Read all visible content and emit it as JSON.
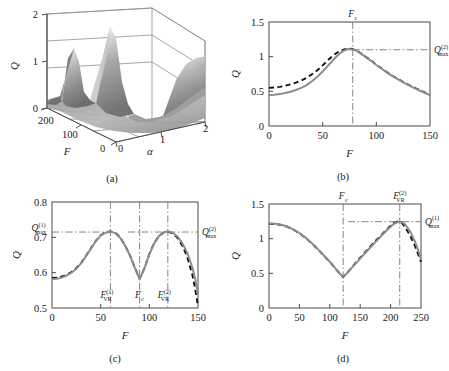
{
  "figure": {
    "panels": [
      {
        "key": "a",
        "caption": "(a)"
      },
      {
        "key": "b",
        "caption": "(b)"
      },
      {
        "key": "c",
        "caption": "(c)"
      },
      {
        "key": "d",
        "caption": "(d)"
      }
    ]
  },
  "chart_data": [
    {
      "id": "a",
      "type": "surface",
      "title": "",
      "caption": "(a)",
      "xlabel": "F",
      "ylabel": "α",
      "zlabel": "Q",
      "xticks": [
        "0",
        "100",
        "200"
      ],
      "xtickvals": [
        0,
        100,
        200
      ],
      "yticks": [
        "0",
        "1",
        "2"
      ],
      "ytickvals": [
        0,
        1,
        2
      ],
      "zticks": [
        "0",
        "1",
        "2"
      ],
      "ztickvals": [
        0,
        1,
        2
      ],
      "xlim": [
        0,
        200
      ],
      "ylim": [
        0,
        2
      ],
      "zlim": [
        0,
        2
      ],
      "colormap": "grayscale",
      "description": "Response amplitude Q surface over F and alpha with two sharp ridge peaks reaching Q near 2 and a valley between them",
      "peaks": [
        {
          "F": 60,
          "alpha": 0.25,
          "Q": 1.95
        },
        {
          "F": 120,
          "alpha": 0.55,
          "Q": 2.0
        }
      ],
      "valley": {
        "F": 95,
        "alpha": 1.1,
        "Q": 0.35
      }
    },
    {
      "id": "b",
      "type": "line",
      "caption": "(b)",
      "xlabel": "F",
      "ylabel": "Q",
      "xlim": [
        0,
        150
      ],
      "ylim": [
        0,
        1.5
      ],
      "xticks": [
        "0",
        "50",
        "100",
        "150"
      ],
      "xtickvals": [
        0,
        50,
        100,
        150
      ],
      "yticks": [
        "0",
        "0.5",
        "1",
        "1.5"
      ],
      "ytickvals": [
        0,
        0.5,
        1,
        1.5
      ],
      "grid": false,
      "annotations": [
        {
          "text": "F",
          "sub": "c",
          "base": "F",
          "kind": "vertical-marker",
          "x": 78,
          "position": "top"
        },
        {
          "text": "Q",
          "sub": "max",
          "sup": "(2)",
          "base": "Q",
          "kind": "horizontal-marker",
          "y": 1.1,
          "position": "right"
        }
      ],
      "series": [
        {
          "name": "theory-dashed",
          "style": "dashed",
          "color": "#111111",
          "x": [
            0,
            5,
            10,
            15,
            20,
            25,
            30,
            35,
            40,
            45,
            50,
            55,
            60,
            65,
            70,
            74,
            78,
            82,
            86,
            90,
            95,
            100,
            105,
            110,
            115,
            120,
            125,
            130,
            135,
            140,
            145,
            150
          ],
          "y": [
            0.55,
            0.555,
            0.565,
            0.58,
            0.6,
            0.625,
            0.655,
            0.695,
            0.745,
            0.805,
            0.875,
            0.95,
            1.02,
            1.075,
            1.105,
            1.115,
            1.11,
            1.085,
            1.045,
            1.0,
            0.945,
            0.885,
            0.83,
            0.775,
            0.725,
            0.68,
            0.635,
            0.595,
            0.555,
            0.52,
            0.485,
            0.45
          ]
        },
        {
          "name": "numerical-solid",
          "style": "solid",
          "color": "#8c8c8c",
          "x": [
            0,
            5,
            10,
            15,
            20,
            25,
            30,
            35,
            40,
            45,
            50,
            55,
            60,
            65,
            70,
            74,
            78,
            82,
            86,
            90,
            95,
            100,
            105,
            110,
            115,
            120,
            125,
            130,
            135,
            140,
            145,
            150
          ],
          "y": [
            0.445,
            0.45,
            0.46,
            0.475,
            0.495,
            0.52,
            0.55,
            0.59,
            0.645,
            0.71,
            0.785,
            0.87,
            0.955,
            1.035,
            1.09,
            1.11,
            1.105,
            1.08,
            1.04,
            0.995,
            0.94,
            0.88,
            0.825,
            0.77,
            0.72,
            0.675,
            0.63,
            0.59,
            0.55,
            0.515,
            0.48,
            0.445
          ]
        }
      ]
    },
    {
      "id": "c",
      "type": "line",
      "caption": "(c)",
      "xlabel": "F",
      "ylabel": "Q",
      "xlim": [
        0,
        150
      ],
      "ylim": [
        0.5,
        0.8
      ],
      "xticks": [
        "0",
        "50",
        "100",
        "150"
      ],
      "xtickvals": [
        0,
        50,
        100,
        150
      ],
      "yticks": [
        "0.5",
        "0.6",
        "0.7",
        "0.8"
      ],
      "ytickvals": [
        0.5,
        0.6,
        0.7,
        0.8
      ],
      "grid": false,
      "annotations": [
        {
          "text": "Q",
          "sub": "max",
          "sup": "(1)",
          "base": "Q",
          "kind": "horizontal-marker",
          "y": 0.715,
          "position": "left"
        },
        {
          "text": "Q",
          "sub": "max",
          "sup": "(2)",
          "base": "Q",
          "kind": "horizontal-marker",
          "y": 0.715,
          "position": "right"
        },
        {
          "text": "F",
          "sub": "VR",
          "sup": "(1)",
          "base": "F",
          "kind": "vertical-marker",
          "x": 60,
          "position": "bottom"
        },
        {
          "text": "F",
          "sub": "c",
          "base": "F",
          "kind": "vertical-marker",
          "x": 90,
          "position": "bottom"
        },
        {
          "text": "F",
          "sub": "VR",
          "sup": "(2)",
          "base": "F",
          "kind": "vertical-marker",
          "x": 119,
          "position": "bottom"
        }
      ],
      "series": [
        {
          "name": "theory-dashed",
          "style": "dashed",
          "color": "#111111",
          "x": [
            0,
            5,
            10,
            15,
            20,
            25,
            30,
            35,
            40,
            45,
            50,
            55,
            60,
            65,
            70,
            75,
            80,
            85,
            90,
            95,
            100,
            105,
            110,
            115,
            119,
            124,
            129,
            134,
            139,
            144,
            147,
            150
          ],
          "y": [
            0.585,
            0.586,
            0.589,
            0.594,
            0.602,
            0.613,
            0.628,
            0.648,
            0.669,
            0.69,
            0.706,
            0.714,
            0.717,
            0.713,
            0.7,
            0.678,
            0.65,
            0.615,
            0.583,
            0.613,
            0.653,
            0.684,
            0.704,
            0.714,
            0.716,
            0.711,
            0.698,
            0.676,
            0.644,
            0.596,
            0.555,
            0.505
          ]
        },
        {
          "name": "numerical-solid",
          "style": "solid",
          "color": "#8c8c8c",
          "x": [
            0,
            5,
            10,
            15,
            20,
            25,
            30,
            35,
            40,
            45,
            50,
            55,
            60,
            65,
            70,
            75,
            80,
            85,
            90,
            95,
            100,
            105,
            110,
            115,
            119,
            124,
            129,
            134,
            139,
            144,
            147,
            150
          ],
          "y": [
            0.582,
            0.583,
            0.586,
            0.592,
            0.6,
            0.611,
            0.627,
            0.647,
            0.668,
            0.689,
            0.705,
            0.713,
            0.716,
            0.712,
            0.699,
            0.677,
            0.649,
            0.614,
            0.582,
            0.612,
            0.652,
            0.683,
            0.704,
            0.714,
            0.717,
            0.713,
            0.702,
            0.683,
            0.656,
            0.616,
            0.585,
            0.54
          ]
        }
      ]
    },
    {
      "id": "d",
      "type": "line",
      "caption": "(d)",
      "xlabel": "F",
      "ylabel": "Q",
      "xlim": [
        0,
        250
      ],
      "ylim": [
        0,
        1.5
      ],
      "xticks": [
        "0",
        "50",
        "100",
        "150",
        "200",
        "250"
      ],
      "xtickvals": [
        0,
        50,
        100,
        150,
        200,
        250
      ],
      "yticks": [
        "0",
        "0.5",
        "1",
        "1.5"
      ],
      "ytickvals": [
        0,
        0.5,
        1,
        1.5
      ],
      "grid": false,
      "annotations": [
        {
          "text": "F",
          "sub": "c",
          "base": "F",
          "kind": "vertical-marker",
          "x": 122,
          "position": "top"
        },
        {
          "text": "F",
          "sub": "VR",
          "sup": "(2)",
          "base": "F",
          "kind": "vertical-marker",
          "x": 215,
          "position": "top"
        },
        {
          "text": "Q",
          "sub": "max",
          "sup": "(1)",
          "base": "Q",
          "kind": "horizontal-marker",
          "y": 1.245,
          "position": "right"
        }
      ],
      "series": [
        {
          "name": "theory-dashed",
          "style": "dashed",
          "color": "#111111",
          "x": [
            0,
            10,
            20,
            30,
            40,
            50,
            60,
            70,
            80,
            90,
            100,
            110,
            118,
            122,
            128,
            136,
            145,
            155,
            165,
            175,
            185,
            195,
            205,
            212,
            218,
            224,
            232,
            240,
            246,
            250
          ],
          "y": [
            1.215,
            1.212,
            1.198,
            1.172,
            1.132,
            1.078,
            1.012,
            0.936,
            0.85,
            0.758,
            0.665,
            0.56,
            0.48,
            0.448,
            0.5,
            0.585,
            0.675,
            0.775,
            0.872,
            0.965,
            1.055,
            1.145,
            1.225,
            1.248,
            1.235,
            1.165,
            1.045,
            0.895,
            0.76,
            0.665
          ]
        },
        {
          "name": "numerical-solid",
          "style": "solid",
          "color": "#8c8c8c",
          "x": [
            0,
            10,
            20,
            30,
            40,
            50,
            60,
            70,
            80,
            90,
            100,
            110,
            118,
            122,
            128,
            136,
            145,
            155,
            165,
            175,
            185,
            195,
            205,
            212,
            218,
            224,
            232,
            240,
            246,
            250
          ],
          "y": [
            1.218,
            1.215,
            1.201,
            1.175,
            1.135,
            1.081,
            1.015,
            0.939,
            0.853,
            0.761,
            0.668,
            0.563,
            0.483,
            0.45,
            0.498,
            0.578,
            0.665,
            0.762,
            0.858,
            0.95,
            1.042,
            1.132,
            1.212,
            1.24,
            1.243,
            1.205,
            1.105,
            0.96,
            0.82,
            0.705
          ]
        }
      ]
    }
  ]
}
